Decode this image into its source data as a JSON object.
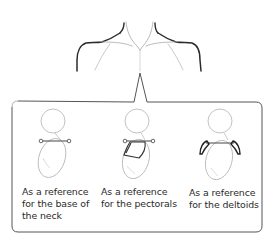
{
  "figure": {
    "top_illustration": "shoulders-and-neck-lines",
    "callout_box": true
  },
  "panels": [
    {
      "caption_lines": [
        "As a reference",
        "for the base of",
        "the neck"
      ],
      "highlight": "neck-base-line"
    },
    {
      "caption_lines": [
        "As a reference",
        "for the pectorals"
      ],
      "highlight": "pectorals"
    },
    {
      "caption_lines": [
        "As a reference",
        "for the deltoids"
      ],
      "highlight": "deltoids"
    }
  ],
  "colors": {
    "stroke_dark": "#2b2b2b",
    "stroke_light": "#b8b8b8",
    "box_border": "#555555"
  }
}
